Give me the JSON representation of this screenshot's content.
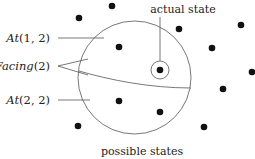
{
  "diagram": {
    "labels": {
      "actual_state": "actual state",
      "possible_states": "possible states",
      "at_1_2_name": "At",
      "at_1_2_args": "(1, 2)",
      "facing_name": "Facing",
      "facing_args": "(2)",
      "at_2_2_name": "At",
      "at_2_2_args": "(2, 2)"
    },
    "big_circle": {
      "cx": 134.5,
      "cy": 77.5,
      "r": 56.5
    },
    "actual_state_dot": {
      "x": 160,
      "y": 70,
      "ring_r": 9
    },
    "dots": [
      {
        "x": 79,
        "y": 18
      },
      {
        "x": 112,
        "y": 6
      },
      {
        "x": 179,
        "y": 29
      },
      {
        "x": 241,
        "y": 25
      },
      {
        "x": 119,
        "y": 47
      },
      {
        "x": 212,
        "y": 48
      },
      {
        "x": 252,
        "y": 72
      },
      {
        "x": 223,
        "y": 89
      },
      {
        "x": 119,
        "y": 101
      },
      {
        "x": 160,
        "y": 112
      },
      {
        "x": 78,
        "y": 126
      },
      {
        "x": 204,
        "y": 127
      }
    ],
    "colors": {
      "dot": "#111111",
      "line": "#555555"
    }
  }
}
